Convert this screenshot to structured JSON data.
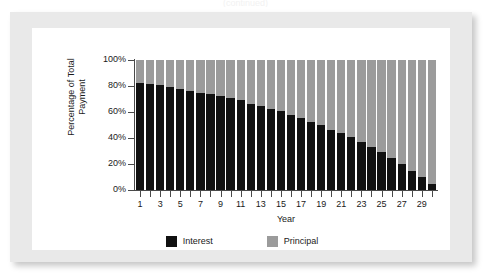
{
  "caption_sliver": "(continued)",
  "chart_data": {
    "type": "bar",
    "subtype": "stacked-100-percent",
    "title": "",
    "xlabel": "Year",
    "ylabel": "Percentage of Total\nPayment",
    "ylim": [
      0,
      100
    ],
    "ytick_labels": [
      "100%",
      "80%",
      "60%",
      "40%",
      "20%",
      "0%"
    ],
    "ytick_values": [
      100,
      80,
      60,
      40,
      20,
      0
    ],
    "grid": false,
    "legend_position": "bottom-center",
    "categories": [
      1,
      2,
      3,
      4,
      5,
      6,
      7,
      8,
      9,
      10,
      11,
      12,
      13,
      14,
      15,
      16,
      17,
      18,
      19,
      20,
      21,
      22,
      23,
      24,
      25,
      26,
      27,
      28,
      29,
      30
    ],
    "xtick_labels": [
      "1",
      "",
      "3",
      "",
      "5",
      "",
      "7",
      "",
      "9",
      "",
      "11",
      "",
      "13",
      "",
      "15",
      "",
      "17",
      "",
      "19",
      "",
      "21",
      "",
      "23",
      "",
      "25",
      "",
      "27",
      "",
      "29",
      ""
    ],
    "series": [
      {
        "name": "Interest",
        "color": "#111111",
        "values": [
          82,
          81.5,
          80.5,
          79,
          78,
          76.5,
          75,
          74,
          72.5,
          70.5,
          69,
          66.5,
          65,
          62.5,
          60.5,
          58,
          55.5,
          52.5,
          50,
          46.5,
          43.5,
          40.5,
          37,
          33,
          29,
          24.5,
          20,
          15,
          10,
          5
        ]
      },
      {
        "name": "Principal",
        "color": "#9b9b9b",
        "values": [
          18,
          18.5,
          19.5,
          21,
          22,
          23.5,
          25,
          26,
          27.5,
          29.5,
          31,
          33.5,
          35,
          37.5,
          39.5,
          42,
          44.5,
          47.5,
          50,
          53.5,
          56.5,
          59.5,
          63,
          67,
          71,
          75.5,
          80,
          85,
          90,
          95
        ]
      }
    ],
    "legend": [
      {
        "label": "Interest",
        "color": "#111111"
      },
      {
        "label": "Principal",
        "color": "#9b9b9b"
      }
    ]
  }
}
